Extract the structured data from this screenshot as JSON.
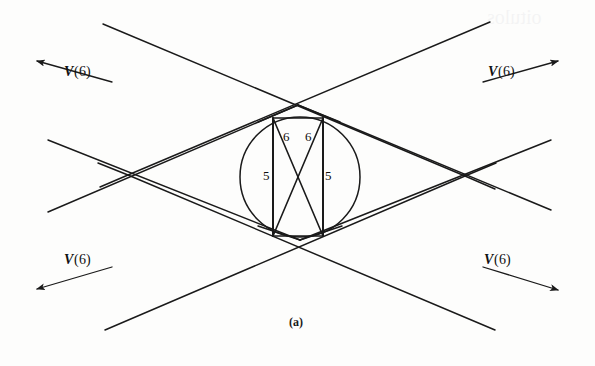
{
  "figure": {
    "caption": "(a)",
    "stroke_color": "#1a1a1a",
    "background_color": "#fdfdfc",
    "arrow_labels": [
      {
        "id": "top-left",
        "text_v": "V",
        "text_arg": "(6)",
        "full": "V(6)"
      },
      {
        "id": "top-right",
        "text_v": "V",
        "text_arg": "(6)",
        "full": "V(6)"
      },
      {
        "id": "bottom-left",
        "text_v": "V",
        "text_arg": "(6)",
        "full": "V(6)"
      },
      {
        "id": "bottom-right",
        "text_v": "V",
        "text_arg": "(6)",
        "full": "V(6)"
      }
    ],
    "edge_labels": [
      {
        "id": "top-left-six",
        "value": "6"
      },
      {
        "id": "top-right-six",
        "value": "6"
      },
      {
        "id": "left-five",
        "value": "5"
      },
      {
        "id": "right-five",
        "value": "5"
      }
    ],
    "geometry": {
      "circle": {
        "cx": 300,
        "cy": 177,
        "r": 60
      },
      "inner_vertical_left_x": 273,
      "inner_vertical_right_x": 323,
      "inner_top_y": 118,
      "inner_bottom_y": 236,
      "apex_top": {
        "x": 298,
        "y": 105
      },
      "apex_bottom": {
        "x": 300,
        "y": 240
      },
      "left_node": {
        "x": 128,
        "y": 175
      },
      "right_node": {
        "x": 465,
        "y": 176
      }
    }
  }
}
